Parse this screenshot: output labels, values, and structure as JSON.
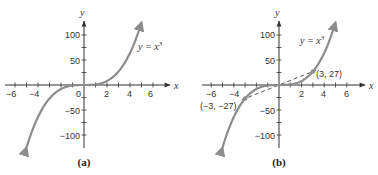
{
  "chart_data": [
    {
      "type": "line",
      "panel": "a",
      "caption": "(a)",
      "title": "",
      "xlabel": "x",
      "ylabel": "y",
      "xlim": [
        -7,
        7
      ],
      "ylim": [
        -120,
        130
      ],
      "x_ticks": [
        -6,
        -4,
        -2,
        0,
        2,
        4,
        6
      ],
      "x_tick_labels": [
        "−6",
        "−4",
        "0",
        "2",
        "4",
        "6"
      ],
      "y_ticks": [
        100,
        50,
        -50,
        -100
      ],
      "y_tick_labels": [
        "100",
        "50",
        "−50",
        "−100"
      ],
      "grid": false,
      "series": [
        {
          "name": "y = x³",
          "function": "x^3",
          "x_range": [
            -5,
            5
          ],
          "color": "#8c8c8c"
        }
      ],
      "annotations": [
        {
          "text": "y = x³",
          "x": 4.7,
          "y": 75
        }
      ]
    },
    {
      "type": "line",
      "panel": "b",
      "caption": "(b)",
      "title": "",
      "xlabel": "x",
      "ylabel": "y",
      "xlim": [
        -7,
        7
      ],
      "ylim": [
        -120,
        130
      ],
      "x_ticks": [
        -6,
        -4,
        -2,
        0,
        2,
        4,
        6
      ],
      "x_tick_labels": [
        "−6",
        "−4",
        "2",
        "4",
        "6"
      ],
      "y_ticks": [
        100,
        50,
        -50,
        -100
      ],
      "y_tick_labels": [
        "100",
        "50",
        "−50",
        "−100"
      ],
      "grid": false,
      "series": [
        {
          "name": "y = x³",
          "function": "x^3",
          "x_range": [
            -5,
            5
          ],
          "color": "#8c8c8c"
        },
        {
          "name": "line through origin",
          "style": "dashed",
          "points": [
            [
              -3,
              -27
            ],
            [
              3,
              27
            ]
          ],
          "color": "#555555"
        }
      ],
      "points": [
        {
          "label": "(3, 27)",
          "x": 3,
          "y": 27
        },
        {
          "label": "(−3, −27)",
          "x": -3,
          "y": -27
        }
      ],
      "annotations": [
        {
          "text": "y = x³",
          "x": 2.3,
          "y": 100
        }
      ]
    }
  ],
  "panel_a": {
    "caption": "(a)",
    "y_axis_label": "y",
    "x_axis_label": "x",
    "equation": "y = x",
    "equation_exp": "3",
    "origin_label": "0",
    "x_labels": [
      "−6",
      "−4",
      "2",
      "4",
      "6"
    ],
    "y_labels": [
      "100",
      "50",
      "−50",
      "−100"
    ]
  },
  "panel_b": {
    "caption": "(b)",
    "y_axis_label": "y",
    "x_axis_label": "x",
    "equation": "y = x",
    "equation_exp": "3",
    "x_labels": [
      "−6",
      "−4",
      "2",
      "4",
      "6"
    ],
    "y_labels": [
      "100",
      "50",
      "−50",
      "−100"
    ],
    "point_pos_label": "(3, 27)",
    "point_neg_label": "(−3, −27)"
  },
  "colors": {
    "curve": "#8c8c8c",
    "axis": "#333333",
    "dashed": "#555555"
  }
}
